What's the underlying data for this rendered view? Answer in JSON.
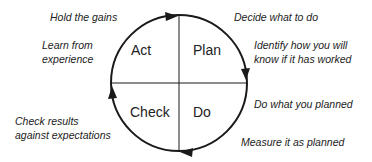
{
  "diagram": {
    "quadrants": [
      {
        "id": "act",
        "label": "Act"
      },
      {
        "id": "plan",
        "label": "Plan"
      },
      {
        "id": "check",
        "label": "Check"
      },
      {
        "id": "do",
        "label": "Do"
      }
    ],
    "annotations": {
      "hold_gains": "Hold the gains",
      "learn_1": "Learn from",
      "learn_2": "experience",
      "decide": "Decide what to do",
      "identify_1": "Identify how you will",
      "identify_2": "know if it has worked",
      "do_what": "Do what you planned",
      "measure": "Measure it as planned",
      "check_1": "Check results",
      "check_2": "against expectations"
    },
    "flow_direction": "clockwise",
    "colors": {
      "line": "#1a1a1a",
      "background": "#ffffff"
    }
  }
}
